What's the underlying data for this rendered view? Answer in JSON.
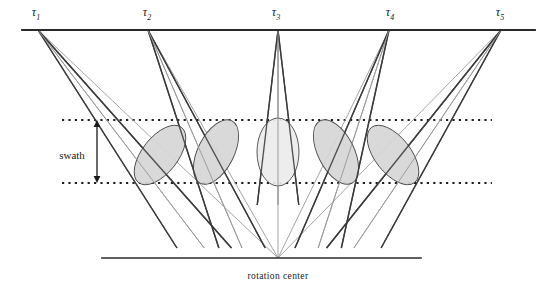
{
  "figure": {
    "type": "diagram",
    "title": "",
    "background_color": "#ffffff",
    "width": 553,
    "height": 301
  },
  "labels": {
    "swath": "swath",
    "rotation_center": "rotation center",
    "tau_symbol": "τ"
  },
  "stations": [
    {
      "name": "tau-1",
      "symbol": "τ",
      "subscript": "1",
      "label_x": 36,
      "label_y": 16,
      "apex_x": 38,
      "apex_y": 30
    },
    {
      "name": "tau-2",
      "symbol": "τ",
      "subscript": "2",
      "label_x": 147,
      "label_y": 16,
      "apex_x": 148,
      "apex_y": 30
    },
    {
      "name": "tau-3",
      "symbol": "τ",
      "subscript": "3",
      "label_x": 276,
      "label_y": 16,
      "apex_x": 278,
      "apex_y": 30
    },
    {
      "name": "tau-4",
      "symbol": "τ",
      "subscript": "4",
      "label_x": 390,
      "label_y": 16,
      "apex_x": 389,
      "apex_y": 30
    },
    {
      "name": "tau-5",
      "symbol": "τ",
      "subscript": "5",
      "label_x": 500,
      "label_y": 16,
      "apex_x": 501,
      "apex_y": 30
    }
  ],
  "geometry": {
    "top_line": {
      "x1": 22,
      "y1": 30,
      "x2": 535,
      "y2": 30,
      "color": "#2a2a2a",
      "width": 1.8
    },
    "bottom_line": {
      "x1": 102,
      "y1": 258,
      "x2": 421,
      "y2": 258,
      "color": "#2a2a2a",
      "width": 1.7
    },
    "rotation_center": {
      "x": 278,
      "y": 258
    },
    "swath_top_y": 120,
    "swath_bottom_y": 183,
    "swath_dotted_x1": 62,
    "swath_dotted_x2": 492,
    "swath_arrow_x": 97,
    "swath_label_x": 72,
    "swath_label_y": 156,
    "rotation_label_x": 278,
    "rotation_label_y": 273
  },
  "colors": {
    "beam_edge": "#3a3a3a",
    "beam_center": "#9a9a9a",
    "ellipse_fill_dark": "#d6d6d6",
    "ellipse_fill_light": "#ececec",
    "ellipse_stroke": "#4a4a4a",
    "dotted_line": "#1f1f1f",
    "text": "#1a1a1a"
  },
  "footprints": [
    {
      "name": "footprint-1",
      "cx": 160,
      "cy": 155,
      "rx": 18,
      "ry": 35,
      "rotation": 38,
      "fill": "#d6d6d6"
    },
    {
      "name": "footprint-2",
      "cx": 216,
      "cy": 152,
      "rx": 18,
      "ry": 35,
      "rotation": 27,
      "fill": "#d6d6d6"
    },
    {
      "name": "footprint-3",
      "cx": 278,
      "cy": 152,
      "rx": 21,
      "ry": 34,
      "rotation": 0,
      "fill": "#ececec"
    },
    {
      "name": "footprint-4",
      "cx": 336,
      "cy": 152,
      "rx": 18,
      "ry": 35,
      "rotation": -27,
      "fill": "#d6d6d6"
    },
    {
      "name": "footprint-5",
      "cx": 393,
      "cy": 155,
      "rx": 18,
      "ry": 35,
      "rotation": -38,
      "fill": "#d6d6d6"
    }
  ],
  "beams": [
    {
      "name": "beam-1",
      "apex_x": 38,
      "apex_y": 30,
      "left_x": 140,
      "left_y": 190,
      "right_x": 180,
      "right_y": 190,
      "center_x": 160,
      "center_y": 190
    },
    {
      "name": "beam-2",
      "apex_x": 148,
      "apex_y": 30,
      "left_x": 200,
      "left_y": 190,
      "right_x": 234,
      "right_y": 190,
      "center_x": 217,
      "center_y": 190
    },
    {
      "name": "beam-3",
      "apex_x": 278,
      "apex_y": 30,
      "left_x": 259,
      "left_y": 190,
      "right_x": 297,
      "right_y": 190,
      "center_x": 278,
      "center_y": 190
    },
    {
      "name": "beam-4",
      "apex_x": 389,
      "apex_y": 30,
      "left_x": 320,
      "left_y": 190,
      "right_x": 354,
      "right_y": 190,
      "center_x": 337,
      "center_y": 190
    },
    {
      "name": "beam-5",
      "apex_x": 501,
      "apex_y": 30,
      "left_x": 373,
      "left_y": 190,
      "right_x": 413,
      "right_y": 190,
      "center_x": 393,
      "center_y": 190
    }
  ],
  "convergence_rays": [
    {
      "name": "ray-1",
      "x1": 38,
      "y1": 30,
      "x2": 278,
      "y2": 258
    },
    {
      "name": "ray-2",
      "x1": 148,
      "y1": 30,
      "x2": 278,
      "y2": 258
    },
    {
      "name": "ray-3",
      "x1": 278,
      "y1": 30,
      "x2": 278,
      "y2": 258
    },
    {
      "name": "ray-4",
      "x1": 389,
      "y1": 30,
      "x2": 278,
      "y2": 258
    },
    {
      "name": "ray-5",
      "x1": 501,
      "y1": 30,
      "x2": 278,
      "y2": 258
    }
  ]
}
